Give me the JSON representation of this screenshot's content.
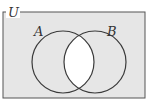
{
  "diagram": {
    "type": "venn",
    "universe_label": "U",
    "sets": [
      {
        "name": "A",
        "label": "A"
      },
      {
        "name": "B",
        "label": "B"
      }
    ],
    "shaded_region": "complement of A∩B",
    "colors": {
      "shade": "#e6e6e6",
      "unshaded": "#ffffff",
      "stroke": "#3a3a3a"
    }
  }
}
